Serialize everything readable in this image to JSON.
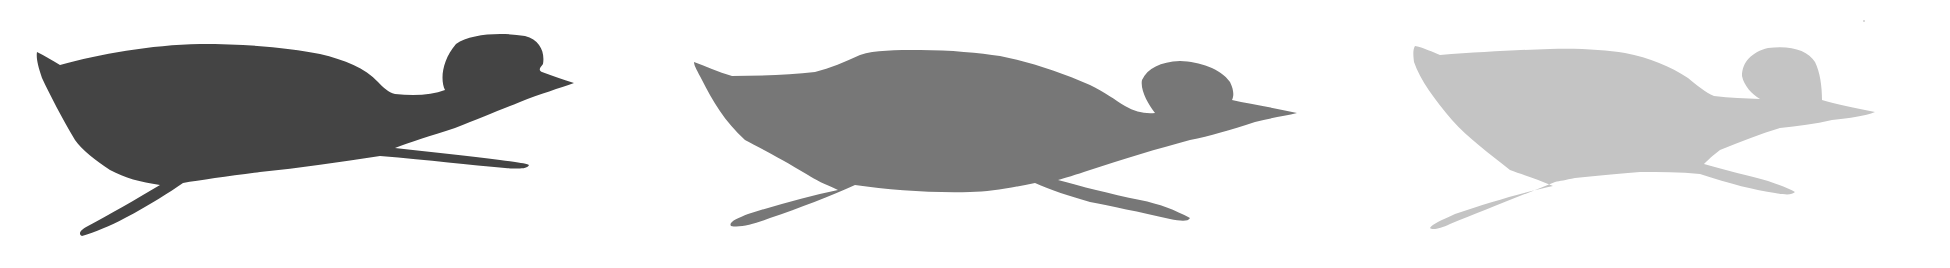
{
  "figure": {
    "background": "#ffffff",
    "silhouettes": [
      {
        "label": "dark",
        "color": "#444444"
      },
      {
        "label": "medium",
        "color": "#777777"
      },
      {
        "label": "light",
        "color": "#c4c4c4"
      }
    ]
  }
}
